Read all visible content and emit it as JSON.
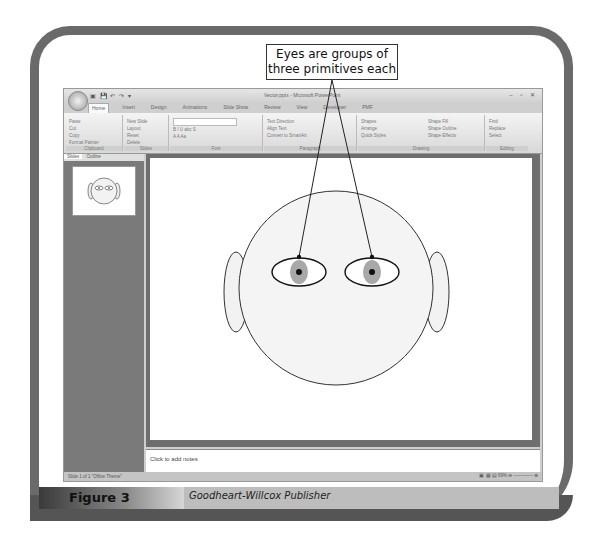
{
  "callout": {
    "line1": "Eyes are groups of",
    "line2": "three primitives each"
  },
  "app": {
    "window_title": "Vector.pptx - Microsoft PowerPoint",
    "quick_access": "▣ 💾 ↶ ↷ ▾",
    "window_controls": "– ▫ ✕",
    "tabs": [
      "Home",
      "Insert",
      "Design",
      "Animations",
      "Slide Show",
      "Review",
      "View",
      "Developer",
      "PMF"
    ],
    "ribbon_groups": [
      {
        "label": "Clipboard",
        "items": [
          "Paste",
          "Cut",
          "Copy",
          "Format Painter"
        ]
      },
      {
        "label": "Slides",
        "items": [
          "New Slide",
          "Layout",
          "Reset",
          "Delete"
        ]
      },
      {
        "label": "Font",
        "items": [
          "B I U abc S",
          "A A Aa"
        ]
      },
      {
        "label": "Paragraph",
        "items": [
          "Text Direction",
          "Align Text",
          "Convert to SmartArt"
        ]
      },
      {
        "label": "Drawing",
        "items": [
          "Shapes",
          "Arrange",
          "Quick Styles",
          "Shape Fill",
          "Shape Outline",
          "Shape Effects"
        ]
      },
      {
        "label": "Editing",
        "items": [
          "Find",
          "Replace",
          "Select"
        ]
      }
    ],
    "panel_tabs": [
      "Slides",
      "Outline"
    ],
    "notes_placeholder": "Click to add notes",
    "status_left": "Slide 1 of 1   \"Office Theme\"",
    "status_right": "▣ ▦ ▤  69%  ⊖ ────── ⊕"
  },
  "caption": {
    "figure": "Figure 3",
    "publisher": "Goodheart-Willcox Publisher"
  },
  "colors": {
    "frame": "#6a6a6a",
    "face_fill": "#f4f4f4",
    "iris": "#a8a8a8",
    "pupil": "#111111"
  }
}
